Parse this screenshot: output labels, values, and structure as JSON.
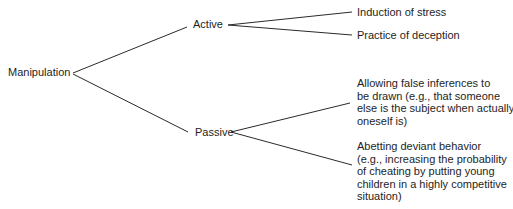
{
  "diagram": {
    "type": "tree",
    "root": {
      "label": "Manipulation",
      "children": [
        {
          "label": "Active",
          "children": [
            {
              "label": "Induction of stress"
            },
            {
              "label": "Practice of deception"
            }
          ]
        },
        {
          "label": "Passive",
          "children": [
            {
              "label": "Allowing false inferences to be drawn (e.g., that someone else is the subject when actually oneself is)",
              "lines": [
                "Allowing false inferences to",
                "be drawn (e.g., that someone",
                "else is the subject when actually",
                "oneself is)"
              ]
            },
            {
              "label": "Abetting deviant behavior (e.g., increasing the probability of cheating by putting young children in a highly competitive situation)",
              "lines": [
                "Abetting deviant behavior",
                "(e.g., increasing the probability",
                "of cheating by putting young",
                "children in a highly competitive",
                "situation)"
              ]
            }
          ]
        }
      ]
    }
  },
  "colors": {
    "line": "#2a2a2a",
    "text": "#1e1e1e",
    "background": "#ffffff"
  }
}
